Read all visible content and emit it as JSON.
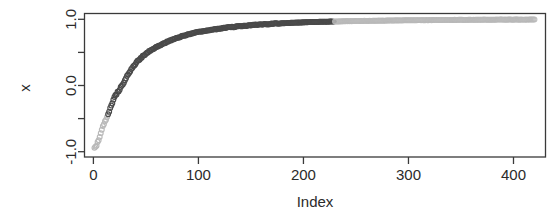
{
  "chart_data": {
    "type": "scatter",
    "title": "",
    "xlabel": "Index",
    "ylabel": "x",
    "xlim": [
      -8,
      430
    ],
    "ylim": [
      -1.08,
      1.08
    ],
    "grid": false,
    "legend": null,
    "x_ticks": [
      0,
      100,
      200,
      300,
      400
    ],
    "x_tick_labels": [
      "0",
      "100",
      "200",
      "300",
      "400"
    ],
    "y_ticks": [
      1.0,
      0.5,
      0.0,
      -0.5,
      -1.0
    ],
    "y_tick_labels": [
      "1.0",
      "",
      "0.0",
      "",
      "-1.0"
    ],
    "y_major_labels": [
      "1.0",
      "0.0",
      "-1.0"
    ],
    "marker": "open-circle",
    "marker_size": 2.4,
    "n_points": 420,
    "x": [
      1,
      3,
      5,
      7,
      9,
      11,
      13,
      15,
      17,
      19,
      21,
      23,
      25,
      27,
      29,
      31,
      33,
      35,
      37,
      39,
      41,
      43,
      45,
      47,
      49,
      51,
      53,
      55,
      57,
      59,
      61,
      63,
      65,
      67,
      69,
      71,
      73,
      75,
      77,
      79,
      81,
      83,
      85,
      87,
      89,
      91,
      93,
      95,
      97,
      99,
      103,
      107,
      111,
      115,
      119,
      123,
      127,
      131,
      135,
      139,
      143,
      147,
      151,
      155,
      159,
      163,
      167,
      171,
      175,
      179,
      183,
      187,
      191,
      195,
      199,
      205,
      211,
      217,
      223,
      229,
      235,
      241,
      247,
      253,
      259,
      265,
      271,
      277,
      283,
      289,
      295,
      301,
      307,
      313,
      319,
      325,
      331,
      337,
      343,
      349,
      355,
      361,
      367,
      373,
      379,
      385,
      391,
      397,
      403,
      409,
      415,
      420
    ],
    "y": [
      -0.95,
      -0.9,
      -0.82,
      -0.72,
      -0.62,
      -0.55,
      -0.47,
      -0.39,
      -0.3,
      -0.22,
      -0.15,
      -0.1,
      -0.06,
      0.0,
      0.05,
      0.11,
      0.17,
      0.22,
      0.27,
      0.31,
      0.35,
      0.38,
      0.41,
      0.44,
      0.47,
      0.49,
      0.52,
      0.54,
      0.56,
      0.575,
      0.59,
      0.605,
      0.62,
      0.635,
      0.65,
      0.665,
      0.68,
      0.693,
      0.705,
      0.716,
      0.727,
      0.737,
      0.747,
      0.756,
      0.765,
      0.773,
      0.781,
      0.789,
      0.796,
      0.803,
      0.815,
      0.827,
      0.838,
      0.848,
      0.857,
      0.866,
      0.874,
      0.881,
      0.888,
      0.894,
      0.9,
      0.906,
      0.911,
      0.916,
      0.92,
      0.924,
      0.928,
      0.932,
      0.936,
      0.939,
      0.942,
      0.945,
      0.948,
      0.95,
      0.953,
      0.956,
      0.959,
      0.962,
      0.964,
      0.967,
      0.969,
      0.971,
      0.973,
      0.975,
      0.976,
      0.978,
      0.979,
      0.981,
      0.982,
      0.983,
      0.984,
      0.985,
      0.986,
      0.987,
      0.988,
      0.989,
      0.99,
      0.99,
      0.991,
      0.992,
      0.992,
      0.993,
      0.993,
      0.994,
      0.994,
      0.995,
      0.995,
      0.996,
      0.996,
      0.996,
      0.997,
      0.997
    ],
    "colors": {
      "axis": "#3a3a3a",
      "text": "#2b2b2b",
      "marker_dark": "#4a4a4a",
      "marker_light": "#b9b9b9",
      "background": "#ffffff"
    }
  }
}
